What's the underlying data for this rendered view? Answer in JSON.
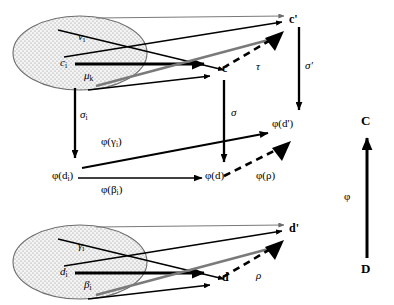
{
  "figure": {
    "type": "category-theory-commutative-diagram",
    "background": "#ffffff",
    "ink_color": "#000000",
    "gray_arrow_color": "#6b6b6b",
    "ellipse_fill": "#f2f2f2",
    "ellipse_stipple": "#9a9a9a",
    "width": 394,
    "height": 305
  },
  "top_object": {
    "name": "c-sub-i-ellipse",
    "center_label": "c",
    "center_sub": "i",
    "upper_label": "ν",
    "upper_sub": "i",
    "lower_label": "μ",
    "lower_sub": "k"
  },
  "bottom_object": {
    "name": "d-sub-i-ellipse",
    "center_label": "d",
    "center_sub": "i",
    "upper_label": "γ",
    "upper_sub": "i",
    "lower_label": "β",
    "lower_sub": "i"
  },
  "nodes": {
    "c": "c",
    "c_prime": "c'",
    "d": "d",
    "d_prime": "d'",
    "phi_d_lower": "φ(d)",
    "phi_d_prime": "φ(d')",
    "phi_di": "φ(d",
    "phi_di_sub": "i",
    "phi_di_close": ")"
  },
  "edge_labels": {
    "tau": "τ",
    "rho": "ρ",
    "sigma": "σ",
    "sigma_prime": "σ'",
    "sigma_i": "σ",
    "sigma_i_sub": "i",
    "phi_gamma_i": "φ(γ",
    "phi_gamma_i_sub": "i",
    "phi_gamma_i_close": ")",
    "phi_beta_i": "φ(β",
    "phi_beta_i_sub": "i",
    "phi_beta_i_close": ")",
    "phi_rho": "φ(ρ)",
    "phi_functor": "φ"
  },
  "categories": {
    "target": "C",
    "source": "D"
  }
}
